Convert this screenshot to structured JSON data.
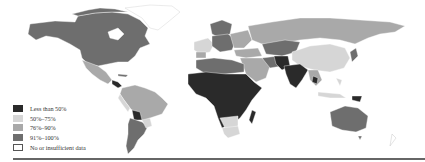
{
  "figure": {
    "type": "choropleth-world-map",
    "legend": {
      "items": [
        {
          "label": "Less than 50%",
          "color": "#2a2a2a"
        },
        {
          "label": "50%–75%",
          "color": "#d6d6d6"
        },
        {
          "label": "76%–90%",
          "color": "#a9a9a9"
        },
        {
          "label": "91%–100%",
          "color": "#6e6e6e"
        },
        {
          "label": "No or insufficient data",
          "color": "#ffffff"
        }
      ]
    },
    "colors": {
      "lt50": "#2a2a2a",
      "c50_75": "#d6d6d6",
      "c76_90": "#a9a9a9",
      "c91_100": "#6e6e6e",
      "nodata": "#ffffff",
      "border": "#ffffff",
      "rule": "#666666"
    }
  }
}
